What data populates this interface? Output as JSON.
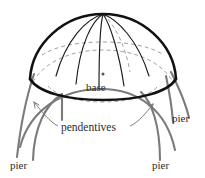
{
  "figure": {
    "background_color": "#ffffff",
    "dome_outline_color": "#111111",
    "meridian_color": "#1a1a1a",
    "hidden_line_color": "#9a9a9a",
    "pier_color": "#7b7b7b",
    "label_color": "#2b2b2b"
  },
  "labels": {
    "base": "base",
    "pendentives": "pendentives",
    "pier_left": "pier",
    "pier_right": "pier",
    "pier_upper_right": "pier"
  },
  "parts": [
    {
      "name": "dome",
      "label": ""
    },
    {
      "name": "base-circle",
      "label": "base"
    },
    {
      "name": "pendentives",
      "label": "pendentives"
    },
    {
      "name": "pier-left",
      "label": "pier"
    },
    {
      "name": "pier-right",
      "label": "pier"
    },
    {
      "name": "pier-back-right",
      "label": "pier"
    }
  ]
}
